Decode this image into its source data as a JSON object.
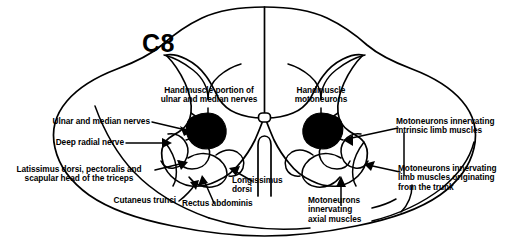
{
  "figure": {
    "segment_label": "C8",
    "colors": {
      "background": "#ffffff",
      "outline": "#000000",
      "filled_pool": "#000000"
    }
  },
  "labels": {
    "handmuscle_portion": "Handmuscle portion of\nulnar and median nerves",
    "handmuscle_motoneurons": "Handmuscle\nmotoneurons",
    "ulnar_median_nerves": "Ulnar and median nerves",
    "deep_radial_nerve": "Deep radial nerve",
    "latissimus_pectoralis": "Latissimus dorsi, pectoralis and\nscapular head of the triceps",
    "cutaneus_trunci": "Cutaneus trunci",
    "rectus_abdominis": "Rectus abdominis",
    "longissimus_dorsi": "Longissimus\ndorsi",
    "motoneurons_intrinsic_limb": "Motoneurons innervating\nintrinsic limb muscles",
    "motoneurons_limb_trunk": "Motoneurons innervating\nlimb muscles originating\nfrom the trunk",
    "motoneurons_axial": "Motoneurons\ninnervating\naxial muscles"
  }
}
